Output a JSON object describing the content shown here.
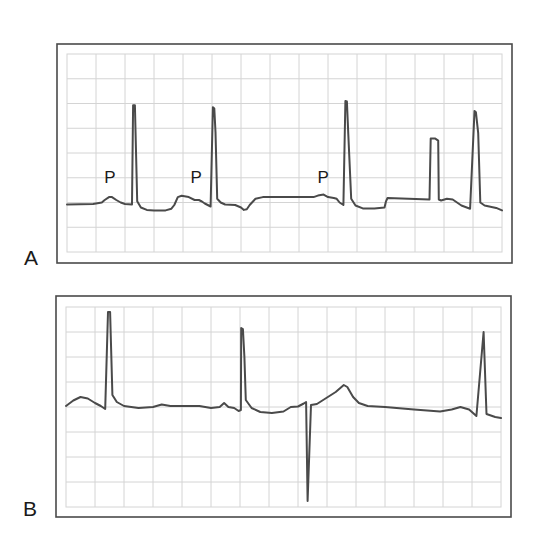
{
  "figure": {
    "units": {
      "x": "grid divisions (time, left to right)",
      "y": "grid divisions (from top of grid, downward)"
    },
    "trace_color": "#4a4a4a",
    "grid_color": "#d4d4d4"
  },
  "panels": [
    {
      "id": "A",
      "label": "A",
      "grid": {
        "columns": 15,
        "rows": 8
      },
      "wave_labels": [
        {
          "text": "P",
          "x": 1.48,
          "y": 5.2
        },
        {
          "text": "P",
          "x": 4.45,
          "y": 5.2
        },
        {
          "text": "P",
          "x": 8.83,
          "y": 5.2
        }
      ],
      "trace": [
        [
          0.0,
          6.08
        ],
        [
          0.9,
          6.06
        ],
        [
          1.2,
          6.0
        ],
        [
          1.3,
          5.9
        ],
        [
          1.45,
          5.78
        ],
        [
          1.55,
          5.78
        ],
        [
          1.7,
          5.9
        ],
        [
          1.85,
          6.0
        ],
        [
          2.0,
          6.06
        ],
        [
          2.24,
          6.08
        ],
        [
          2.28,
          2.07
        ],
        [
          2.34,
          2.07
        ],
        [
          2.42,
          5.95
        ],
        [
          2.55,
          6.2
        ],
        [
          2.75,
          6.3
        ],
        [
          3.0,
          6.32
        ],
        [
          3.4,
          6.32
        ],
        [
          3.6,
          6.25
        ],
        [
          3.7,
          6.1
        ],
        [
          3.82,
          5.78
        ],
        [
          3.95,
          5.73
        ],
        [
          4.2,
          5.78
        ],
        [
          4.4,
          5.9
        ],
        [
          4.55,
          5.9
        ],
        [
          4.65,
          5.96
        ],
        [
          4.75,
          6.04
        ],
        [
          4.95,
          6.16
        ],
        [
          5.03,
          2.15
        ],
        [
          5.08,
          2.2
        ],
        [
          5.12,
          3.15
        ],
        [
          5.18,
          5.85
        ],
        [
          5.3,
          6.0
        ],
        [
          5.45,
          6.08
        ],
        [
          5.8,
          6.1
        ],
        [
          6.0,
          6.2
        ],
        [
          6.1,
          6.3
        ],
        [
          6.2,
          6.27
        ],
        [
          6.3,
          6.1
        ],
        [
          6.5,
          5.85
        ],
        [
          6.75,
          5.78
        ],
        [
          8.0,
          5.78
        ],
        [
          8.5,
          5.78
        ],
        [
          8.65,
          5.72
        ],
        [
          8.85,
          5.68
        ],
        [
          9.0,
          5.78
        ],
        [
          9.2,
          5.82
        ],
        [
          9.3,
          5.85
        ],
        [
          9.4,
          6.0
        ],
        [
          9.53,
          6.1
        ],
        [
          9.6,
          1.9
        ],
        [
          9.65,
          1.92
        ],
        [
          9.7,
          3.25
        ],
        [
          9.8,
          5.85
        ],
        [
          9.95,
          6.12
        ],
        [
          10.2,
          6.24
        ],
        [
          10.6,
          6.24
        ],
        [
          10.95,
          6.2
        ],
        [
          11.0,
          5.95
        ],
        [
          11.05,
          5.82
        ],
        [
          12.5,
          5.88
        ],
        [
          12.54,
          3.42
        ],
        [
          12.7,
          3.42
        ],
        [
          12.8,
          3.5
        ],
        [
          12.82,
          5.88
        ],
        [
          12.9,
          5.92
        ],
        [
          13.1,
          5.85
        ],
        [
          13.3,
          5.88
        ],
        [
          13.6,
          6.12
        ],
        [
          13.9,
          6.25
        ],
        [
          14.05,
          2.3
        ],
        [
          14.1,
          2.35
        ],
        [
          14.18,
          3.2
        ],
        [
          14.25,
          6.0
        ],
        [
          14.4,
          6.12
        ],
        [
          14.8,
          6.22
        ],
        [
          15.0,
          6.32
        ]
      ]
    },
    {
      "id": "B",
      "label": "B",
      "grid": {
        "columns": 15,
        "rows": 8
      },
      "wave_labels": [],
      "trace": [
        [
          0.0,
          3.96
        ],
        [
          0.25,
          3.74
        ],
        [
          0.5,
          3.6
        ],
        [
          0.75,
          3.66
        ],
        [
          1.0,
          3.84
        ],
        [
          1.2,
          3.96
        ],
        [
          1.35,
          4.08
        ],
        [
          1.45,
          0.2
        ],
        [
          1.52,
          0.2
        ],
        [
          1.6,
          3.52
        ],
        [
          1.75,
          3.8
        ],
        [
          2.0,
          3.96
        ],
        [
          2.5,
          4.04
        ],
        [
          3.0,
          4.0
        ],
        [
          3.3,
          3.9
        ],
        [
          3.6,
          3.96
        ],
        [
          4.6,
          3.96
        ],
        [
          5.0,
          4.04
        ],
        [
          5.3,
          4.0
        ],
        [
          5.45,
          3.84
        ],
        [
          5.6,
          4.0
        ],
        [
          5.8,
          4.04
        ],
        [
          5.95,
          4.16
        ],
        [
          6.03,
          4.12
        ],
        [
          6.04,
          0.84
        ],
        [
          6.1,
          0.88
        ],
        [
          6.15,
          2.0
        ],
        [
          6.2,
          3.72
        ],
        [
          6.4,
          4.04
        ],
        [
          6.7,
          4.2
        ],
        [
          7.1,
          4.24
        ],
        [
          7.5,
          4.18
        ],
        [
          7.75,
          4.0
        ],
        [
          8.0,
          3.98
        ],
        [
          8.2,
          3.86
        ],
        [
          8.28,
          3.8
        ],
        [
          8.33,
          7.76
        ],
        [
          8.45,
          3.92
        ],
        [
          8.65,
          3.88
        ],
        [
          8.95,
          3.66
        ],
        [
          9.3,
          3.4
        ],
        [
          9.58,
          3.12
        ],
        [
          9.7,
          3.2
        ],
        [
          9.9,
          3.6
        ],
        [
          10.1,
          3.84
        ],
        [
          10.4,
          3.96
        ],
        [
          11.0,
          4.0
        ],
        [
          12.0,
          4.1
        ],
        [
          12.9,
          4.18
        ],
        [
          13.3,
          4.1
        ],
        [
          13.6,
          4.0
        ],
        [
          13.9,
          4.1
        ],
        [
          14.15,
          4.36
        ],
        [
          14.4,
          1.0
        ],
        [
          14.5,
          4.28
        ],
        [
          14.8,
          4.4
        ],
        [
          15.0,
          4.44
        ]
      ]
    }
  ]
}
